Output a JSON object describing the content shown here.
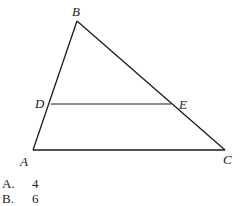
{
  "figure": {
    "type": "triangle-with-parallel-segment",
    "points": {
      "A": {
        "label": "A",
        "x": 33,
        "y": 150
      },
      "B": {
        "label": "B",
        "x": 77,
        "y": 21
      },
      "C": {
        "label": "C",
        "x": 225,
        "y": 150
      },
      "D": {
        "label": "D",
        "x": 50,
        "y": 104
      },
      "E": {
        "label": "E",
        "x": 171,
        "y": 104
      }
    },
    "segments": [
      [
        "A",
        "B"
      ],
      [
        "B",
        "C"
      ],
      [
        "A",
        "C"
      ],
      [
        "D",
        "E"
      ]
    ],
    "stroke_color": "#1a1a1a"
  },
  "choices": [
    {
      "letter": "A.",
      "value": "4"
    },
    {
      "letter": "B.",
      "value": "6"
    }
  ]
}
